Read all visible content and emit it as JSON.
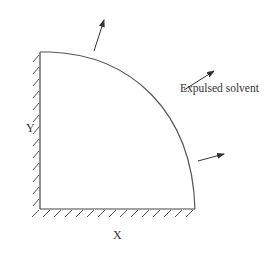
{
  "diagram": {
    "labels": {
      "y_axis": "Y",
      "x_axis": "X",
      "annotation": "Expulsed solvent"
    },
    "colors": {
      "stroke": "#444444",
      "text": "#333333",
      "background": "#ffffff"
    },
    "shape": "quarter-ellipse region bounded by hatched walls on left (Y) and bottom (X)",
    "arrows_count": 3
  }
}
